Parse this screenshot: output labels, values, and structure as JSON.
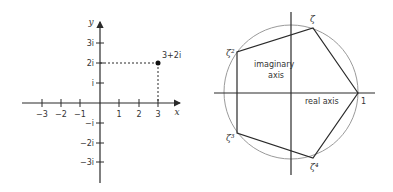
{
  "left_diagram": {
    "x_axis_label": "x",
    "y_axis_label": "y",
    "x_ticks": [
      "−3",
      "−2",
      "−1",
      "1",
      "2",
      "3"
    ],
    "y_ticks": [
      "3i",
      "2i",
      "i",
      "−i",
      "−2i",
      "−3i"
    ],
    "point_label": "3+2i",
    "point": {
      "re": 3,
      "im": 2
    }
  },
  "right_diagram": {
    "imaginary_axis_label_1": "imaginary",
    "imaginary_axis_label_2": "axis",
    "real_axis_label": "real axis",
    "vertices": [
      "1",
      "ζ",
      "ζ²",
      "ζ³",
      "ζ⁴"
    ]
  },
  "colors": {
    "axis": "#2a2a2a",
    "circle": "#9a9a9a",
    "text": "#333333"
  }
}
